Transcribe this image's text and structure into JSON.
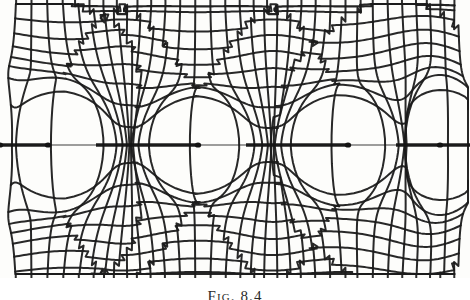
{
  "figure": {
    "caption": "Fig. 8.4",
    "caption_visible_fragment": "Fig. 8.4",
    "kind": "conformal-mapping-flow-net",
    "ink_color": "#1b1b1b",
    "paper_color": "#fdfdfb",
    "plate": {
      "x": 0,
      "y": 0,
      "width": 470,
      "height": 278
    }
  },
  "chart_data": {
    "type": "line",
    "title": "Fig. 8.4",
    "xlabel": "",
    "ylabel": "",
    "grid": true,
    "legend": false,
    "xlim": [
      0,
      470
    ],
    "ylim": [
      0,
      278
    ],
    "plot_box": {
      "left": 18,
      "right": 455,
      "top": 15,
      "bottom": 264
    },
    "axis_line_y": 145,
    "singularities": [
      {
        "x": 0,
        "y": 145,
        "label": "s0"
      },
      {
        "x": 48,
        "y": 145,
        "label": "s1"
      },
      {
        "x": 198,
        "y": 145,
        "label": "s2"
      },
      {
        "x": 348,
        "y": 145,
        "label": "s3"
      },
      {
        "x": 440,
        "y": 145,
        "label": "s4"
      }
    ],
    "period_px": 150,
    "slit_segments": [
      {
        "x1": 0,
        "x2": 48,
        "y": 145
      },
      {
        "x1": 96,
        "x2": 198,
        "y": 145
      },
      {
        "x1": 246,
        "x2": 348,
        "y": 145
      },
      {
        "x1": 396,
        "x2": 470,
        "y": 145
      }
    ],
    "n_vertical_curves": 33,
    "n_horizontal_curves": 17,
    "tick_overhang_top_px": 6,
    "tick_overhang_bottom_px": 6,
    "series": [
      {
        "name": "equipotentials",
        "orientation": "vertical",
        "count": 33
      },
      {
        "name": "streamlines",
        "orientation": "horizontal",
        "count": 17
      }
    ]
  }
}
